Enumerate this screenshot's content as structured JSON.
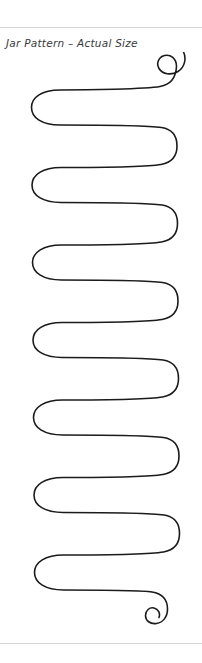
{
  "page": {
    "width": 202,
    "height": 663,
    "background_color": "#ffffff",
    "rules": {
      "color": "#d6d6d8",
      "top_label": "top-divider",
      "bottom_label": "bottom-divider"
    }
  },
  "caption": {
    "text": "Jar Pattern – Actual Size",
    "color": "#3a3a3c",
    "style": "italic"
  },
  "pattern": {
    "name": "jar-pattern-serpentine-line",
    "description": "Continuous hand-drawn meander / serpentine scroll line with inward spiral terminals at the top right and bottom right",
    "stroke_color": "#1b1b1d",
    "stroke_width": 1.6,
    "fill": "none",
    "left_turn_x": 32,
    "right_turn_x": 175,
    "row_count": 15,
    "spiral_top": "clockwise-inward",
    "spiral_bottom": "clockwise-inward",
    "path": "M176.5 14.5 C176.5 6.5 170.5 2.0 164.5 3.5 C158.5 5.0 156.0 11.5 159.0 16.5 C162.5 22.5 171.5 23.5 178.0 19.5 C185.0 15.2 186.5 6.0 183.5 0.0 M176.5 14.5 C176.0 25.0 171.0 32.5 160.0 34.5 C146.0 37.0 86.0 38.0 60.0 38.0 C42.0 38.0 31.5 45.0 31.5 55.5 C31.5 66.0 42.0 73.0 60.0 73.0 C86.0 73.0 148.0 73.5 161.5 75.5 C172.5 77.2 177.0 84.5 177.0 94.0 C177.0 103.5 172.0 110.5 161.0 112.5 C147.0 115.0 87.0 115.5 61.0 115.5 C43.0 115.5 32.0 122.5 32.0 133.0 C32.0 143.5 43.0 150.5 61.0 150.5 C87.0 150.5 148.5 151.0 162.0 153.0 C173.0 154.7 177.5 162.0 177.5 171.5 C177.5 181.0 172.5 188.0 161.5 190.0 C147.5 192.5 87.5 193.0 61.5 193.0 C43.5 193.0 32.5 200.0 32.5 210.5 C32.5 221.0 43.5 228.0 61.5 228.0 C87.5 228.0 149.0 228.5 162.5 230.5 C173.5 232.2 178.0 239.5 178.0 249.0 C178.0 258.5 173.0 265.5 162.0 267.5 C148.0 270.0 88.0 270.5 62.0 270.5 C44.0 270.5 33.0 277.5 33.0 288.0 C33.0 298.5 44.0 305.5 62.0 305.5 C88.0 305.5 149.5 306.0 163.0 308.0 C174.0 309.7 178.5 317.0 178.5 326.5 C178.5 336.0 173.5 343.0 162.5 345.0 C148.5 347.5 88.5 348.0 62.5 348.0 C44.5 348.0 33.5 355.0 33.5 365.5 C33.5 376.0 44.5 383.0 62.5 383.0 C88.5 383.0 150.0 383.5 163.5 385.5 C174.5 387.2 179.0 394.5 179.0 404.0 C179.0 413.5 174.0 420.5 163.0 422.5 C149.0 425.0 89.0 425.5 63.0 425.5 C45.0 425.5 34.0 432.5 34.0 443.0 C34.0 453.5 45.0 460.5 63.0 460.5 C89.0 460.5 150.5 461.0 164.0 463.0 C175.0 464.7 179.5 472.0 179.5 481.5 C179.5 491.0 174.5 498.0 163.5 500.0 C149.5 502.5 89.5 503.0 63.5 503.0 C45.5 503.0 34.5 510.0 34.5 520.5 C34.5 531.0 45.5 538.0 63.5 538.0 C89.5 538.0 140.0 538.0 152.0 540.0 C163.0 541.8 167.5 548.5 167.5 557.0 C167.5 565.0 163.0 570.5 156.5 571.5 C150.0 572.5 145.5 568.5 145.5 563.5 C145.5 558.5 149.5 555.0 154.0 556.0 C158.5 557.0 160.5 561.5 159.0 565.5"
  }
}
